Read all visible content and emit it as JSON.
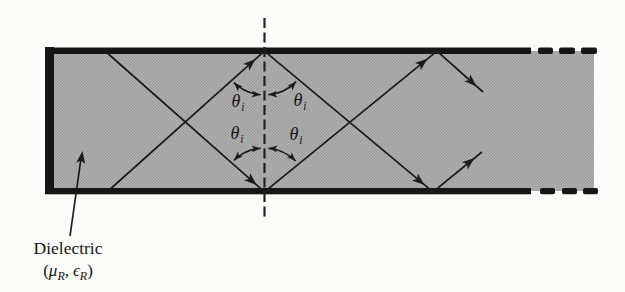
{
  "figure": {
    "kind": "dielectric-slab-waveguide-diagram",
    "colors": {
      "background": "#fbfbf8",
      "slab_fill_average": "#a8a8a8",
      "slab_fill_dark": "#9c9c9c",
      "slab_fill_light": "#b2b2b2",
      "ink": "#1b1b1b"
    },
    "angle_label": {
      "theta": "θ",
      "subscript": "i"
    },
    "dielectric_label": {
      "name": "Dielectric",
      "open_paren": "(",
      "mu": "μ",
      "mu_subscript": "R",
      "separator": ",",
      "epsilon": "ϵ",
      "epsilon_subscript": "R",
      "close_paren": ")"
    }
  }
}
